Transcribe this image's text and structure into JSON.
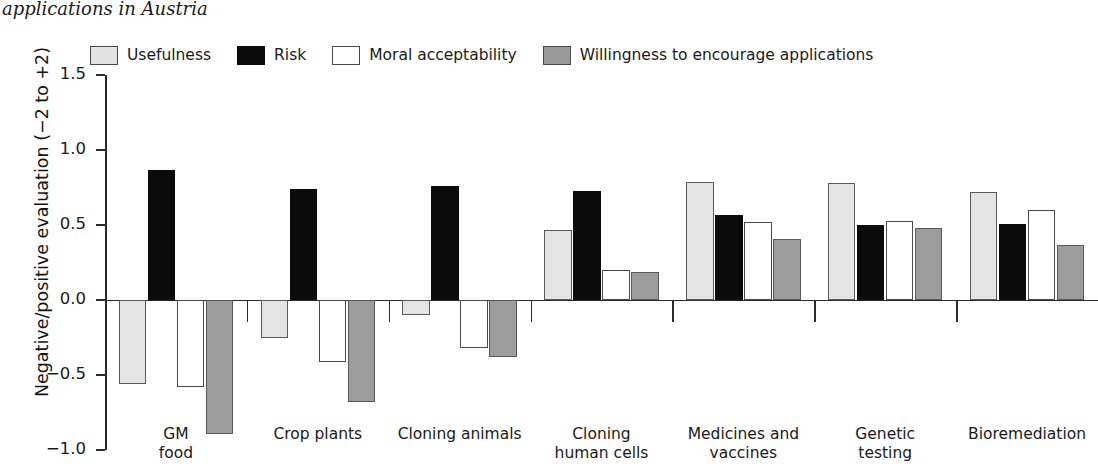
{
  "caption": {
    "text": "applications in Austria"
  },
  "legend": {
    "items": [
      {
        "label": "Usefulness",
        "color": "#e4e4e4",
        "key": "usefulness"
      },
      {
        "label": "Risk",
        "color": "#0b0b0b",
        "key": "risk"
      },
      {
        "label": "Moral acceptability",
        "color": "#ffffff",
        "key": "moral"
      },
      {
        "label": "Willingness to encourage applications",
        "color": "#9c9c9c",
        "key": "willingness"
      }
    ]
  },
  "axes": {
    "ylabel": "Negative/positive evaluation (−2 to +2)",
    "yticks": [
      "1.5",
      "1.0",
      "0.5",
      "0.0",
      "−0.5",
      "−1.0"
    ],
    "ytick_values": [
      1.5,
      1.0,
      0.5,
      0.0,
      -0.5,
      -1.0
    ]
  },
  "chart_data": {
    "type": "bar",
    "title": "applications in Austria",
    "xlabel": "",
    "ylabel": "Negative/positive evaluation (−2 to +2)",
    "ylim": [
      -1.0,
      1.5
    ],
    "grid": false,
    "legend_position": "top",
    "categories": [
      "GM food",
      "Crop plants",
      "Cloning animals",
      "Cloning human cells",
      "Medicines and vaccines",
      "Genetic testing",
      "Bioremediation"
    ],
    "category_lines": [
      [
        "GM",
        "food"
      ],
      [
        "Crop plants",
        ""
      ],
      [
        "Cloning animals",
        ""
      ],
      [
        "Cloning",
        "human cells"
      ],
      [
        "Medicines and",
        "vaccines"
      ],
      [
        "Genetic",
        "testing"
      ],
      [
        "Bioremediation",
        ""
      ]
    ],
    "series": [
      {
        "name": "Usefulness",
        "color": "#e4e4e4",
        "values": [
          -0.56,
          -0.25,
          -0.1,
          0.47,
          0.79,
          0.78,
          0.72
        ]
      },
      {
        "name": "Risk",
        "color": "#0b0b0b",
        "values": [
          0.87,
          0.74,
          0.76,
          0.73,
          0.57,
          0.5,
          0.51
        ]
      },
      {
        "name": "Moral acceptability",
        "color": "#ffffff",
        "values": [
          -0.58,
          -0.41,
          -0.32,
          0.2,
          0.52,
          0.53,
          0.6
        ]
      },
      {
        "name": "Willingness to encourage applications",
        "color": "#9c9c9c",
        "values": [
          -0.89,
          -0.68,
          -0.38,
          0.19,
          0.41,
          0.48,
          0.37
        ]
      }
    ]
  }
}
